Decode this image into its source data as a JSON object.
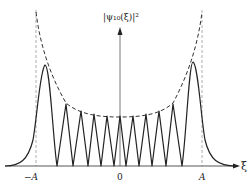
{
  "figure": {
    "y_axis_label": "|ψ₁₀(ξ)|²",
    "x_axis_label": "ξ",
    "ticks": [
      {
        "label": "−A",
        "position": "left turning point"
      },
      {
        "label": "0",
        "position": "origin"
      },
      {
        "label": "A",
        "position": "right turning point"
      }
    ],
    "curves": [
      {
        "name": "probability density",
        "style": "solid",
        "color": "#222222"
      },
      {
        "name": "classical envelope",
        "style": "dashed",
        "color": "#333333"
      },
      {
        "name": "turning point markers",
        "style": "dashed-vertical",
        "color": "#888888"
      }
    ],
    "quantum_number": 10,
    "peak_count": 11
  }
}
